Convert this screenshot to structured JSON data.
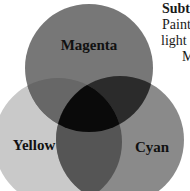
{
  "diagram": {
    "circles": [
      {
        "name": "magenta",
        "label": "Magenta",
        "cx": 89,
        "cy": 68,
        "r": 64,
        "fill": "#777777"
      },
      {
        "name": "yellow",
        "label": "Yellow",
        "cx": 58,
        "cy": 142,
        "r": 64,
        "fill": "#c9c9c9"
      },
      {
        "name": "cyan",
        "label": "Cyan",
        "cx": 120,
        "cy": 140,
        "r": 64,
        "fill": "#8a8a8a"
      }
    ],
    "overlaps": {
      "magenta_yellow": "#676767",
      "magenta_cyan": "#2b2b2b",
      "yellow_cyan": "#555555",
      "all": "#0a0a0a"
    }
  },
  "side_text": {
    "heading": "Subt",
    "line1": "Paint",
    "line2": "light",
    "line3": "M"
  }
}
